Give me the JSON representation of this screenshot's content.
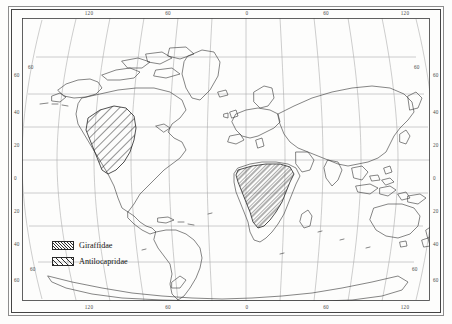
{
  "figure": {
    "type": "world-distribution-map",
    "projection": "robinson",
    "background": "#fdfdfc",
    "outline_color": "#333333",
    "graticule_color": "#9a9a9a"
  },
  "chart_data": {
    "type": "map",
    "title": "",
    "xlabel": "",
    "ylabel": "",
    "projection": "robinson",
    "xlim": [
      -180,
      180
    ],
    "ylim": [
      -90,
      90
    ],
    "grid": true,
    "graticule": {
      "meridian_interval": 30,
      "parallel_interval": 20,
      "labeled_meridians": [
        -120,
        -60,
        0,
        60,
        120
      ],
      "labeled_parallels": [
        60,
        40,
        20,
        0,
        -20,
        -40,
        -60
      ]
    },
    "axes": {
      "top_ticks": [
        "120",
        "60",
        "0",
        "60",
        "120"
      ],
      "bottom_ticks": [
        "120",
        "60",
        "0",
        "60",
        "120"
      ],
      "left_ticks": [
        "60",
        "40",
        "20",
        "0",
        "20",
        "40",
        "60"
      ],
      "right_ticks": [
        "60",
        "40",
        "20",
        "0",
        "20",
        "40",
        "60"
      ],
      "interior_corner_labels": [
        "60",
        "60",
        "60",
        "60"
      ]
    },
    "series": [
      {
        "name": "Giraffidae",
        "pattern": "fine-diagonal-hatch",
        "hatch_angle_deg": 45,
        "hatch_spacing_px": 2.1,
        "region": "sub-Saharan Africa",
        "approx_extent": {
          "lon": [
            -17,
            52
          ],
          "lat": [
            -34,
            18
          ]
        }
      },
      {
        "name": "Antilocapridae",
        "pattern": "coarse-diagonal-hatch",
        "hatch_angle_deg": 45,
        "hatch_spacing_px": 3.4,
        "region": "western North America",
        "approx_extent": {
          "lon": [
            -125,
            -98
          ],
          "lat": [
            20,
            53
          ]
        }
      }
    ],
    "legend": {
      "position": "lower-left",
      "entries": [
        {
          "label": "Giraffidae",
          "pattern": "fine-diagonal-hatch"
        },
        {
          "label": "Antilocapridae",
          "pattern": "coarse-diagonal-hatch"
        }
      ]
    }
  },
  "axis_labels": {
    "top": [
      {
        "text": "120",
        "x": 67
      },
      {
        "text": "60",
        "x": 146
      },
      {
        "text": "0",
        "x": 225
      },
      {
        "text": "60",
        "x": 304
      },
      {
        "text": "120",
        "x": 383
      }
    ],
    "bottom": [
      {
        "text": "120",
        "x": 67
      },
      {
        "text": "60",
        "x": 146
      },
      {
        "text": "0",
        "x": 225
      },
      {
        "text": "60",
        "x": 304
      },
      {
        "text": "120",
        "x": 383
      }
    ],
    "left": [
      {
        "text": "60",
        "y": 57
      },
      {
        "text": "40",
        "y": 94
      },
      {
        "text": "20",
        "y": 127
      },
      {
        "text": "0",
        "y": 160
      },
      {
        "text": "20",
        "y": 193
      },
      {
        "text": "40",
        "y": 226
      },
      {
        "text": "60",
        "y": 262
      }
    ],
    "right": [
      {
        "text": "60",
        "y": 57
      },
      {
        "text": "40",
        "y": 94
      },
      {
        "text": "20",
        "y": 127
      },
      {
        "text": "0",
        "y": 160
      },
      {
        "text": "20",
        "y": 193
      },
      {
        "text": "40",
        "y": 226
      },
      {
        "text": "60",
        "y": 262
      }
    ]
  },
  "legend": {
    "giraffidae": "Giraffidae",
    "antilocapridae": "Antilocapridae"
  }
}
